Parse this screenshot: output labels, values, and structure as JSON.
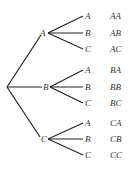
{
  "diagram": {
    "type": "tree",
    "root": "",
    "branches": [
      {
        "label": "A",
        "leaves": [
          "A",
          "B",
          "C"
        ],
        "outcomes": [
          "AA",
          "AB",
          "AC"
        ]
      },
      {
        "label": "B",
        "leaves": [
          "A",
          "B",
          "C"
        ],
        "outcomes": [
          "BA",
          "BB",
          "BC"
        ]
      },
      {
        "label": "C",
        "leaves": [
          "A",
          "B",
          "C"
        ],
        "outcomes": [
          "CA",
          "CB",
          "CC"
        ]
      }
    ]
  }
}
